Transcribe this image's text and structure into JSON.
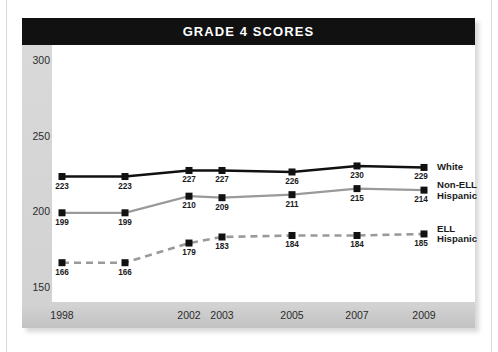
{
  "chart_data": {
    "type": "line",
    "title": "GRADE 4 SCORES",
    "xlabel": "",
    "ylabel": "",
    "x": [
      1998,
      2000,
      2002,
      2003,
      2005,
      2007,
      2009
    ],
    "x_tick_labels": [
      "1998",
      "",
      "2002",
      "2003",
      "2005",
      "2007",
      "2009"
    ],
    "y_ticks": [
      150,
      200,
      250,
      300
    ],
    "y_tick_labels": [
      "150",
      "200",
      "250",
      "300"
    ],
    "ylim": [
      140,
      310
    ],
    "grid": false,
    "legend_position": "right",
    "series": [
      {
        "name": "White",
        "legend_label": "White",
        "color": "#111111",
        "style": "solid",
        "values": [
          223,
          223,
          227,
          227,
          226,
          230,
          229
        ],
        "labels": [
          "223",
          "223",
          "227",
          "227",
          "226",
          "230",
          "229"
        ]
      },
      {
        "name": "Non-ELL Hispanic",
        "legend_label": "Non-ELL Hispanic",
        "legend_label_line1": "Non-ELL",
        "legend_label_line2": "Hispanic",
        "color": "#9a9a9a",
        "style": "solid",
        "values": [
          199,
          199,
          210,
          209,
          211,
          215,
          214
        ],
        "labels": [
          "199",
          "199",
          "210",
          "209",
          "211",
          "215",
          "214"
        ]
      },
      {
        "name": "ELL Hispanic",
        "legend_label": "ELL Hispanic",
        "legend_label_line1": "ELL",
        "legend_label_line2": "Hispanic",
        "color": "#9a9a9a",
        "style": "dashed",
        "values": [
          166,
          166,
          179,
          183,
          184,
          184,
          185
        ],
        "labels": [
          "166",
          "166",
          "179",
          "183",
          "184",
          "184",
          "185"
        ]
      }
    ],
    "marker": "square",
    "marker_color": "#111111",
    "colors": {
      "banner_background": "#111111",
      "banner_text": "#ffffff",
      "axis_band": "#d5d5d5",
      "plot_background": "#ffffff",
      "series_dark": "#111111",
      "series_gray": "#9a9a9a"
    }
  }
}
